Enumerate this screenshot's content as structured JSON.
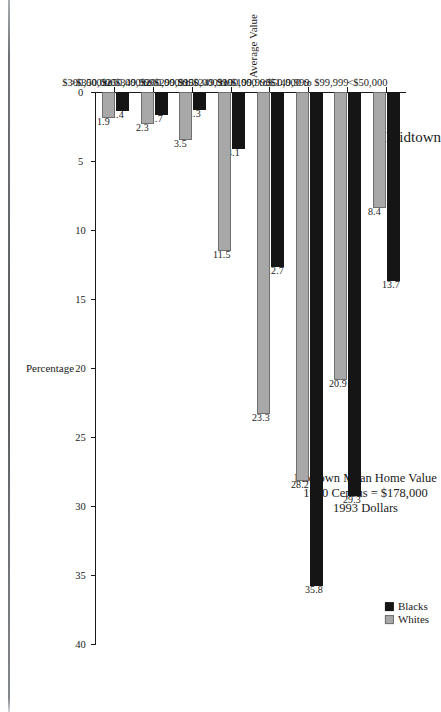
{
  "chart_data": {
    "type": "bar",
    "title": "Midtown",
    "orientation": "horizontal",
    "categories": [
      "<$50,000",
      "$50,000 to $99,999",
      "$100,000 to $149,999",
      "$150,000 to $199,999",
      "$200,000 to $249,999",
      "$250,000 to $299,999",
      "$300,000 to $349,999",
      ">$350,000"
    ],
    "series": [
      {
        "name": "Blacks",
        "color": "#151515",
        "values": [
          13.7,
          29.3,
          35.8,
          12.7,
          4.1,
          1.3,
          1.7,
          1.4
        ]
      },
      {
        "name": "Whites",
        "color": "#a8a8a8",
        "values": [
          8.4,
          20.9,
          28.2,
          23.3,
          11.5,
          3.5,
          2.3,
          1.9
        ]
      }
    ],
    "xlabel": "Average Value",
    "ylabel": "Percentage",
    "ylim": [
      0,
      40
    ],
    "yticks": [
      "0",
      "5",
      "10",
      "15",
      "20",
      "25",
      "30",
      "35",
      "40"
    ],
    "grid": false,
    "legend_position": "top-right",
    "annotation_lines": [
      "Midtown Mean Home Value",
      "1990 Census = $178,000",
      "1993 Dollars"
    ]
  }
}
